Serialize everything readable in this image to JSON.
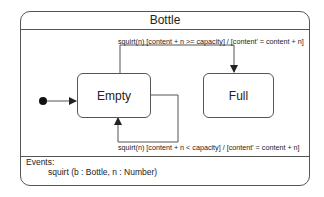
{
  "diagram": {
    "type": "UML state machine",
    "title": "Bottle",
    "states": [
      {
        "id": "empty",
        "label": "Empty"
      },
      {
        "id": "full",
        "label": "Full"
      }
    ],
    "initial_state": "empty",
    "transitions": [
      {
        "from": "empty",
        "to": "full",
        "label": "squirt(n) [content + n >= capacity] / [content' = content + n]"
      },
      {
        "from": "empty",
        "to": "empty",
        "label": "squirt(n) [content + n < capacity] / [content' = content + n]"
      }
    ],
    "events_section": {
      "title": "Events:",
      "items": [
        "squirt (b : Bottle, n : Number)"
      ]
    },
    "colors": {
      "line": "#555555",
      "text": "#222222",
      "background": "#ffffff"
    }
  }
}
